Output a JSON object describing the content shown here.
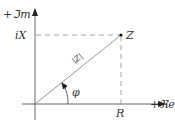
{
  "diagram": {
    "axes": {
      "imag_label": "+ℑm",
      "real_label": "+ℜe"
    },
    "point": {
      "label": "Z",
      "real_projection_label": "R",
      "imag_projection_label": "iX"
    },
    "magnitude_label": "|Z|",
    "angle_label": "φ",
    "colors": {
      "axis": "#555555",
      "vector": "#8a8a8a",
      "text": "#333333"
    }
  }
}
